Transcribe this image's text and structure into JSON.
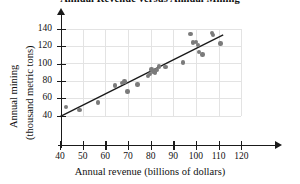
{
  "chart_data": {
    "type": "scatter",
    "title": "Annual Revenue versus Annual Mining",
    "xlabel": "Annual revenue (billions of dollars)",
    "ylabel_line1": "Annual mining",
    "ylabel_line2": "(thousand metric tons)",
    "xlim": [
      40,
      120
    ],
    "ylim": [
      40,
      140
    ],
    "xticks": [
      40,
      50,
      60,
      70,
      80,
      90,
      100,
      110,
      120
    ],
    "yticks": [
      40,
      60,
      80,
      100,
      120,
      140
    ],
    "grid": true,
    "legend": "none",
    "marker_color": "#7b7b7b",
    "line_color": "#1a1a1a",
    "points": [
      {
        "x": 42.6,
        "y": 50
      },
      {
        "x": 48.6,
        "y": 46.5
      },
      {
        "x": 56.8,
        "y": 55
      },
      {
        "x": 64.4,
        "y": 74.5
      },
      {
        "x": 67.4,
        "y": 77.5
      },
      {
        "x": 68.4,
        "y": 79.5
      },
      {
        "x": 69.8,
        "y": 68
      },
      {
        "x": 74.2,
        "y": 76
      },
      {
        "x": 78.8,
        "y": 85.5
      },
      {
        "x": 79.6,
        "y": 88
      },
      {
        "x": 80.4,
        "y": 93
      },
      {
        "x": 81.2,
        "y": 91
      },
      {
        "x": 82.0,
        "y": 89.5
      },
      {
        "x": 82.6,
        "y": 92.5
      },
      {
        "x": 83.6,
        "y": 96.5
      },
      {
        "x": 86.6,
        "y": 96
      },
      {
        "x": 94.2,
        "y": 101
      },
      {
        "x": 97.6,
        "y": 134
      },
      {
        "x": 98.6,
        "y": 124
      },
      {
        "x": 100.0,
        "y": 125
      },
      {
        "x": 100.8,
        "y": 121
      },
      {
        "x": 101.2,
        "y": 113
      },
      {
        "x": 102.8,
        "y": 110.5
      },
      {
        "x": 107.2,
        "y": 135
      },
      {
        "x": 107.6,
        "y": 133
      },
      {
        "x": 110.8,
        "y": 123
      }
    ],
    "trend_line": {
      "x1": 40,
      "y1": 39,
      "x2": 112,
      "y2": 133
    }
  }
}
